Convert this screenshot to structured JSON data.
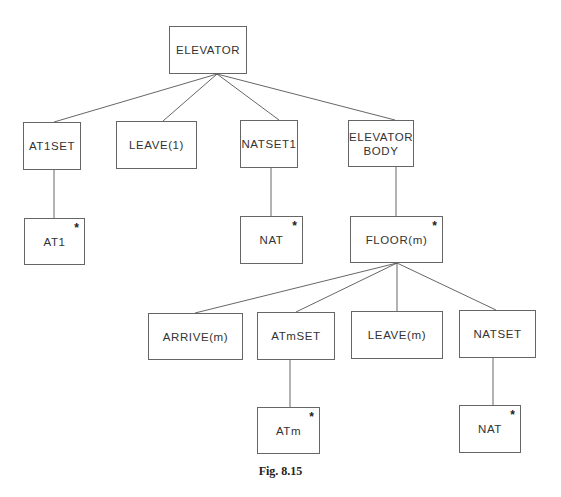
{
  "diagram": {
    "type": "tree",
    "nodes": {
      "elevator": {
        "label": "ELEVATOR",
        "iterated": false
      },
      "at1set": {
        "label": "AT1SET",
        "iterated": false
      },
      "leave1": {
        "label": "LEAVE(1)",
        "iterated": false
      },
      "natset1": {
        "label": "NATSET1",
        "iterated": false
      },
      "elevator_body": {
        "label": "ELEVATOR\nBODY",
        "iterated": false
      },
      "at1": {
        "label": "AT1",
        "iterated": true,
        "marker": "*"
      },
      "nat_upper": {
        "label": "NAT",
        "iterated": true,
        "marker": "*"
      },
      "floor_m": {
        "label": "FLOOR(m)",
        "iterated": true,
        "marker": "*"
      },
      "arrive_m": {
        "label": "ARRIVE(m)",
        "iterated": false
      },
      "atmset": {
        "label": "ATmSET",
        "iterated": false
      },
      "leave_m": {
        "label": "LEAVE(m)",
        "iterated": false
      },
      "natset": {
        "label": "NATSET",
        "iterated": false
      },
      "atm": {
        "label": "ATm",
        "iterated": true,
        "marker": "*"
      },
      "nat_lower": {
        "label": "NAT",
        "iterated": true,
        "marker": "*"
      }
    },
    "edges": [
      [
        "elevator",
        "at1set"
      ],
      [
        "elevator",
        "leave1"
      ],
      [
        "elevator",
        "natset1"
      ],
      [
        "elevator",
        "elevator_body"
      ],
      [
        "at1set",
        "at1"
      ],
      [
        "natset1",
        "nat_upper"
      ],
      [
        "elevator_body",
        "floor_m"
      ],
      [
        "floor_m",
        "arrive_m"
      ],
      [
        "floor_m",
        "atmset"
      ],
      [
        "floor_m",
        "leave_m"
      ],
      [
        "floor_m",
        "natset"
      ],
      [
        "atmset",
        "atm"
      ],
      [
        "natset",
        "nat_lower"
      ]
    ]
  },
  "caption": "Fig. 8.15"
}
